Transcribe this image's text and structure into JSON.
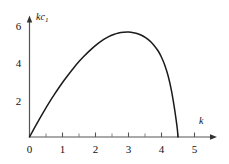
{
  "figure": {
    "background_color": "#ffffff",
    "line_color": "#1a1a1a",
    "axis_color": "#555555"
  },
  "axis_titles": {
    "y_main": "kc",
    "y_sub": "1",
    "x": "k"
  },
  "chart_data": {
    "type": "line",
    "title": "",
    "subtitle": "",
    "xlabel": "k",
    "ylabel": "kc₁",
    "xlim": [
      0,
      5.4
    ],
    "ylim": [
      0,
      6.6
    ],
    "grid": false,
    "legend": null,
    "legend_position": "none",
    "x_ticks": [
      0,
      1,
      2,
      3,
      4,
      5
    ],
    "x_tick_labels": [
      "0",
      "1",
      "2",
      "3",
      "4",
      "5"
    ],
    "x_minor_ticks": [
      0.5,
      1.5,
      2.5,
      3.5,
      4.5
    ],
    "y_ticks": [
      2,
      4,
      6
    ],
    "y_tick_labels": [
      "2",
      "4",
      "6"
    ],
    "y_minor_ticks": [],
    "annotations": [],
    "series": [
      {
        "name": "kc1 vs k",
        "x": [
          0,
          0.15,
          0.3,
          0.45,
          0.6,
          0.75,
          0.9,
          1.05,
          1.2,
          1.35,
          1.5,
          1.65,
          1.8,
          1.95,
          2.1,
          2.25,
          2.4,
          2.55,
          2.7,
          2.85,
          3.0,
          3.15,
          3.3,
          3.45,
          3.6,
          3.75,
          3.9,
          4.0,
          4.1,
          4.2,
          4.3,
          4.38,
          4.44,
          4.48,
          4.5
        ],
        "y": [
          0,
          0.48,
          0.95,
          1.4,
          1.83,
          2.24,
          2.63,
          3.0,
          3.35,
          3.68,
          3.99,
          4.27,
          4.53,
          4.77,
          4.98,
          5.16,
          5.31,
          5.42,
          5.5,
          5.54,
          5.55,
          5.52,
          5.45,
          5.33,
          5.15,
          4.9,
          4.55,
          4.22,
          3.8,
          3.24,
          2.47,
          1.66,
          0.95,
          0.42,
          0
        ]
      }
    ],
    "peak": {
      "x": 3.0,
      "y": 5.55
    },
    "zero_crossings": [
      0,
      4.5
    ]
  },
  "tick_labels_x": [
    {
      "text": "0",
      "value": 0
    },
    {
      "text": "1",
      "value": 1
    },
    {
      "text": "2",
      "value": 2
    },
    {
      "text": "3",
      "value": 3
    },
    {
      "text": "4",
      "value": 4
    },
    {
      "text": "5",
      "value": 5
    }
  ],
  "tick_labels_y": [
    {
      "text": "2",
      "value": 2
    },
    {
      "text": "4",
      "value": 4
    },
    {
      "text": "6",
      "value": 6
    }
  ]
}
